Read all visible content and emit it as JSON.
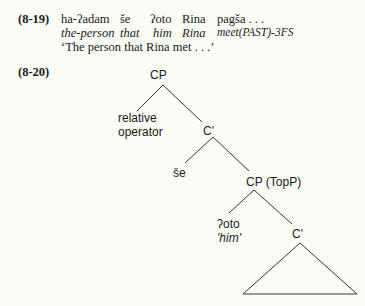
{
  "example_8_19": {
    "number": "(8-19)",
    "words": [
      "ha-ʔadam",
      "še",
      "ʔoto",
      "Rina",
      "pagša . . ."
    ],
    "gloss": [
      "the-person",
      "that",
      "him",
      "Rina",
      "meet(PAST)-3FS"
    ],
    "translation": "‘The person that Rina met . . .’"
  },
  "example_8_20": {
    "number": "(8-20)",
    "tree": {
      "root": "CP",
      "spec_line1": "relative",
      "spec_line2": "operator",
      "cbar1": "C'",
      "comp": "še",
      "cp_topp": "CP (TopP)",
      "topic": "ʔoto",
      "topic_gloss": "'him'",
      "cbar2": "C'"
    }
  }
}
